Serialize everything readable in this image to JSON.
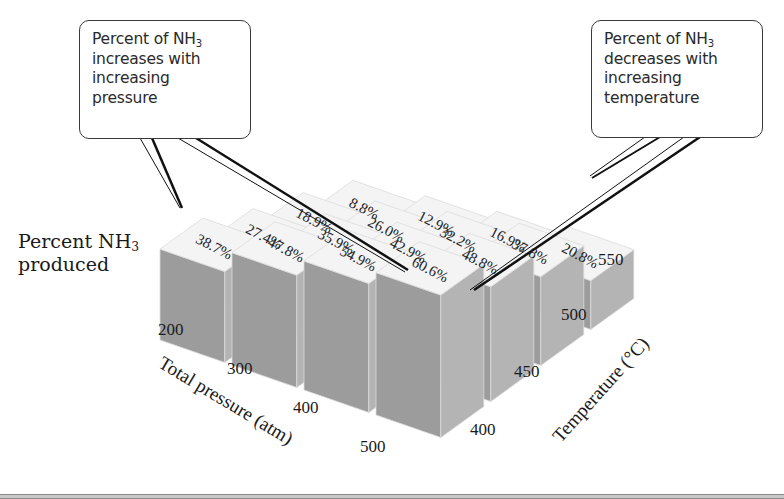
{
  "callouts": {
    "left": {
      "line1_prefix": "Percent of NH",
      "line1_sub": "3",
      "line2": "increases with",
      "line3": "increasing",
      "line4": "pressure"
    },
    "right": {
      "line1_prefix": "Percent of NH",
      "line1_sub": "3",
      "line2": "decreases with",
      "line3": "increasing",
      "line4": "temperature"
    }
  },
  "y_label": {
    "line1_prefix": "Percent NH",
    "line1_sub": "3",
    "line2": "produced"
  },
  "colors": {
    "block_top": "#f4f4f4",
    "block_front": "#9c9c9c",
    "block_side": "#b4b4b4",
    "block_edge": "#dcdcdc",
    "leader_line": "#111111",
    "background": "#ffffff"
  },
  "chart_data": {
    "type": "bar3d",
    "title": "",
    "xlabel": "Total pressure (atm)",
    "ylabel": "Temperature (°C)",
    "zlabel": "Percent NH3 produced",
    "x": [
      "200",
      "300",
      "400",
      "500"
    ],
    "y": [
      "400",
      "450",
      "500",
      "550"
    ],
    "series": [
      {
        "name": "400 °C",
        "values": [
          38.7,
          47.8,
          54.9,
          60.6
        ]
      },
      {
        "name": "450 °C",
        "values": [
          27.4,
          35.9,
          42.9,
          48.8
        ]
      },
      {
        "name": "500 °C",
        "values": [
          18.9,
          26.0,
          32.2,
          37.8
        ]
      },
      {
        "name": "550 °C",
        "values": [
          8.8,
          12.9,
          16.9,
          20.8
        ]
      }
    ],
    "value_labels": [
      [
        "38.7%",
        "47.8%",
        "54.9%",
        "60.6%"
      ],
      [
        "27.4%",
        "35.9%",
        "42.9%",
        "48.8%"
      ],
      [
        "18.9%",
        "26.0%",
        "32.2%",
        "37.8%"
      ],
      [
        "8.8%",
        "12.9%",
        "16.9%",
        "20.8%"
      ]
    ],
    "annotations": [
      "Percent of NH3 increases with increasing pressure",
      "Percent of NH3 decreases with increasing temperature"
    ],
    "grid": false,
    "legend": "none"
  }
}
